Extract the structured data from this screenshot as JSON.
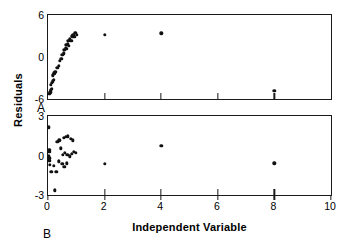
{
  "figure": {
    "ylabel": "Residuals",
    "xlabel": "Independent Variable",
    "panel_a_label": "A",
    "panel_b_label": "B",
    "point_color": "#111111",
    "axis_color": "#1a1a1a"
  },
  "chart_data": [
    {
      "type": "scatter",
      "panel": "A",
      "title": "",
      "xlabel": "",
      "ylabel": "Residuals",
      "xlim": [
        0,
        10
      ],
      "ylim": [
        -6,
        6
      ],
      "xticks": [
        0,
        2,
        4,
        6,
        8,
        10
      ],
      "xticklabels": [
        "0",
        "2",
        "4",
        "6",
        "8",
        "10"
      ],
      "yticks": [
        6,
        0,
        -6
      ],
      "yticklabels": [
        "6",
        "0",
        "-6"
      ],
      "grid": false,
      "legend": "none",
      "points": [
        [
          0.05,
          -5.25
        ],
        [
          0.08,
          -5.05
        ],
        [
          0.1,
          -4.75
        ],
        [
          0.13,
          -4.55
        ],
        [
          0.1,
          -3.95
        ],
        [
          0.14,
          -3.7
        ],
        [
          0.17,
          -3.45
        ],
        [
          0.2,
          -3.25
        ],
        [
          0.17,
          -2.6
        ],
        [
          0.22,
          -2.35
        ],
        [
          0.26,
          -2.15
        ],
        [
          0.33,
          -1.55
        ],
        [
          0.38,
          -1.3
        ],
        [
          0.42,
          -0.55
        ],
        [
          0.47,
          -0.3
        ],
        [
          0.5,
          0.35
        ],
        [
          0.55,
          0.55
        ],
        [
          0.58,
          1.05
        ],
        [
          0.62,
          1.25
        ],
        [
          0.66,
          1.15
        ],
        [
          0.64,
          1.7
        ],
        [
          0.7,
          1.85
        ],
        [
          0.74,
          1.6
        ],
        [
          0.72,
          2.35
        ],
        [
          0.78,
          2.55
        ],
        [
          0.82,
          2.3
        ],
        [
          0.86,
          2.95
        ],
        [
          0.9,
          3.15
        ],
        [
          0.93,
          2.85
        ],
        [
          0.97,
          3.45
        ],
        [
          1.02,
          3.2
        ],
        [
          2.0,
          3.2
        ],
        [
          4.0,
          3.4
        ],
        [
          8.0,
          -4.8
        ]
      ]
    },
    {
      "type": "scatter",
      "panel": "B",
      "title": "",
      "xlabel": "Independent Variable",
      "ylabel": "Residuals",
      "xlim": [
        0,
        10
      ],
      "ylim": [
        -3,
        3
      ],
      "xticks": [
        0,
        2,
        4,
        6,
        8,
        10
      ],
      "xticklabels": [
        "0",
        "2",
        "4",
        "6",
        "8",
        "10"
      ],
      "yticks": [
        3,
        0,
        -3
      ],
      "yticklabels": [
        "3",
        "0",
        "-3"
      ],
      "grid": false,
      "legend": "none",
      "points": [
        [
          0.02,
          2.15
        ],
        [
          0.05,
          0.45
        ],
        [
          0.04,
          0.3
        ],
        [
          0.03,
          -0.05
        ],
        [
          0.05,
          -0.2
        ],
        [
          0.04,
          -0.4
        ],
        [
          0.06,
          -0.7
        ],
        [
          0.2,
          -0.8
        ],
        [
          0.12,
          -1.25
        ],
        [
          0.3,
          -1.25
        ],
        [
          0.25,
          -2.65
        ],
        [
          0.33,
          1.05
        ],
        [
          0.4,
          1.15
        ],
        [
          0.55,
          1.35
        ],
        [
          0.62,
          1.4
        ],
        [
          0.7,
          1.45
        ],
        [
          0.8,
          1.25
        ],
        [
          0.88,
          1.15
        ],
        [
          0.45,
          0.55
        ],
        [
          0.52,
          0.05
        ],
        [
          0.6,
          0.2
        ],
        [
          0.68,
          0.05
        ],
        [
          0.76,
          -0.05
        ],
        [
          0.84,
          0.15
        ],
        [
          0.92,
          0.3
        ],
        [
          0.98,
          0.2
        ],
        [
          0.38,
          -0.45
        ],
        [
          0.5,
          -0.65
        ],
        [
          0.58,
          -0.85
        ],
        [
          0.66,
          -0.6
        ],
        [
          2.0,
          -0.65
        ],
        [
          4.0,
          0.75
        ],
        [
          8.0,
          -0.6
        ]
      ]
    }
  ]
}
